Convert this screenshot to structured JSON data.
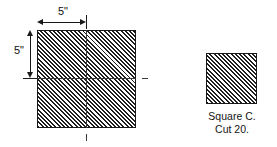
{
  "figure": {
    "background_color": "#ffffff",
    "line_color": "#1a1a1a",
    "hatch_fill_color": "#6e6e6e",
    "hatch_line_color": "#1f1f1f"
  },
  "big_square": {
    "name": "large hatched square",
    "width_dimension": {
      "label": "5\"",
      "value": 5,
      "unit": "inch",
      "orientation": "horizontal",
      "position": "top"
    },
    "height_dimension": {
      "label": "5\"",
      "value": 5,
      "unit": "inch",
      "orientation": "vertical",
      "position": "left"
    },
    "centerlines": {
      "horizontal": true,
      "vertical": true
    }
  },
  "small_square": {
    "name": "small hatched square",
    "caption_line_1": "Square C.",
    "caption_line_2": "Cut 20."
  }
}
